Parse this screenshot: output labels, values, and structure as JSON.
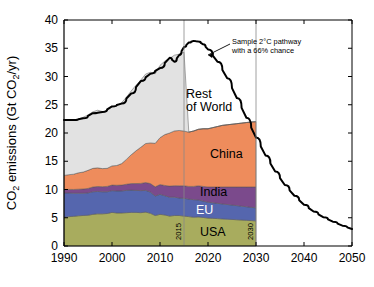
{
  "chart_data": {
    "type": "area",
    "title": "",
    "xlabel": "",
    "ylabel": "CO2 emissions (Gt CO2/yr)",
    "ylabel_parts": {
      "prefix": "CO",
      "sub1": "2",
      "mid": " emissions (Gt CO",
      "sub2": "2",
      "suffix": "/yr)"
    },
    "xlim": [
      1990,
      2050
    ],
    "ylim": [
      0,
      40
    ],
    "xticks": [
      1990,
      2000,
      2010,
      2020,
      2030,
      2040,
      2050
    ],
    "xtick_labels": [
      "1990",
      "2000",
      "2010",
      "2020",
      "2030",
      "2040",
      "2050"
    ],
    "yticks": [
      0,
      5,
      10,
      15,
      20,
      25,
      30,
      35,
      40
    ],
    "ytick_labels": [
      "0",
      "5",
      "10",
      "15",
      "20",
      "25",
      "30",
      "35",
      "40"
    ],
    "grid": false,
    "legend_position": "inline-labels",
    "stacked": true,
    "stack_x": [
      1990,
      1991,
      1992,
      1993,
      1994,
      1995,
      1996,
      1997,
      1998,
      1999,
      2000,
      2001,
      2002,
      2003,
      2004,
      2005,
      2006,
      2007,
      2008,
      2009,
      2010,
      2011,
      2012,
      2013,
      2014,
      2015,
      2016,
      2017,
      2018,
      2019,
      2020,
      2021,
      2022,
      2023,
      2024,
      2025,
      2026,
      2027,
      2028,
      2029,
      2030
    ],
    "series": [
      {
        "name": "USA",
        "color": "#A8AC5E",
        "label": "USA",
        "label_color": "#000000",
        "values": [
          5.1,
          5.2,
          5.25,
          5.35,
          5.4,
          5.45,
          5.6,
          5.7,
          5.7,
          5.75,
          5.95,
          5.85,
          5.85,
          5.9,
          5.95,
          5.95,
          5.9,
          6.0,
          5.8,
          5.4,
          5.6,
          5.5,
          5.3,
          5.4,
          5.4,
          5.3,
          5.2,
          5.1,
          5.15,
          5.05,
          4.95,
          4.9,
          4.85,
          4.8,
          4.75,
          4.7,
          4.65,
          4.6,
          4.55,
          4.5,
          4.45
        ]
      },
      {
        "name": "EU",
        "color": "#5566AE",
        "label": "EU",
        "label_color": "#ffffff",
        "values": [
          4.3,
          4.2,
          4.1,
          4.0,
          3.95,
          3.95,
          4.0,
          3.95,
          3.9,
          3.85,
          3.85,
          3.9,
          3.9,
          3.95,
          3.95,
          3.9,
          3.9,
          3.85,
          3.75,
          3.45,
          3.55,
          3.4,
          3.35,
          3.25,
          3.1,
          3.15,
          3.1,
          3.1,
          3.0,
          2.9,
          2.8,
          2.75,
          2.7,
          2.65,
          2.6,
          2.55,
          2.5,
          2.45,
          2.4,
          2.35,
          2.3
        ]
      },
      {
        "name": "India",
        "color": "#7B4A8C",
        "label": "India",
        "label_color": "#000000",
        "values": [
          0.6,
          0.62,
          0.66,
          0.7,
          0.74,
          0.79,
          0.84,
          0.88,
          0.9,
          0.95,
          0.98,
          1.0,
          1.03,
          1.08,
          1.14,
          1.2,
          1.28,
          1.38,
          1.5,
          1.62,
          1.72,
          1.82,
          1.95,
          2.02,
          2.15,
          2.2,
          2.25,
          2.35,
          2.5,
          2.6,
          2.7,
          2.8,
          2.9,
          3.0,
          3.1,
          3.2,
          3.3,
          3.4,
          3.5,
          3.6,
          3.7
        ]
      },
      {
        "name": "China",
        "color": "#EE8C5C",
        "label": "China",
        "label_color": "#000000",
        "values": [
          2.5,
          2.6,
          2.7,
          2.9,
          3.0,
          3.2,
          3.3,
          3.3,
          3.2,
          3.2,
          3.4,
          3.5,
          3.8,
          4.4,
          5.1,
          5.8,
          6.4,
          6.9,
          7.2,
          7.7,
          8.3,
          9.0,
          9.4,
          9.7,
          9.8,
          9.7,
          9.6,
          9.8,
          10.0,
          10.2,
          10.3,
          10.5,
          10.7,
          10.9,
          11.0,
          11.1,
          11.2,
          11.3,
          11.4,
          11.5,
          11.55
        ]
      },
      {
        "name": "Rest of World",
        "color": "#E2E2E2",
        "label": "Rest\nof World",
        "label_color": "#000000",
        "values": [
          9.8,
          9.7,
          9.6,
          9.5,
          9.7,
          9.8,
          10.0,
          10.2,
          10.1,
          10.2,
          10.5,
          10.6,
          10.8,
          11.0,
          11.3,
          11.6,
          11.9,
          12.3,
          12.5,
          12.3,
          12.8,
          13.0,
          13.2,
          13.4,
          13.5,
          13.95,
          0,
          0,
          0,
          0,
          0,
          0,
          0,
          0,
          0,
          0,
          0,
          0,
          0,
          0,
          0
        ]
      }
    ],
    "stack_totals": [
      22.3,
      22.3,
      22.3,
      22.45,
      22.8,
      23.2,
      23.7,
      24.0,
      23.8,
      23.95,
      24.7,
      24.8,
      25.4,
      26.4,
      27.5,
      28.5,
      29.4,
      30.4,
      30.8,
      30.5,
      32.0,
      32.7,
      33.2,
      33.8,
      34.0,
      36.3,
      36.2,
      36.3,
      36.3,
      36.2,
      36.1,
      36.0,
      35.9,
      35.8,
      35.7,
      35.6,
      35.5,
      35.4,
      35.3,
      35.2,
      22.0
    ],
    "pathway": {
      "name": "Sample 2°C pathway with a 66% chance",
      "color": "#000000",
      "x": [
        1990,
        1992,
        1994,
        1996,
        1998,
        2000,
        2002,
        2004,
        2006,
        2008,
        2010,
        2012,
        2013,
        2014,
        2015,
        2016,
        2017,
        2018,
        2019,
        2020,
        2022,
        2024,
        2026,
        2028,
        2030,
        2032,
        2034,
        2036,
        2038,
        2040,
        2042,
        2044,
        2046,
        2048,
        2050
      ],
      "y": [
        22.3,
        22.3,
        22.6,
        23.5,
        23.7,
        24.7,
        25.2,
        27.0,
        29.2,
        30.5,
        31.5,
        33.3,
        32.6,
        33.8,
        35.2,
        36.0,
        36.3,
        36.2,
        35.7,
        34.8,
        32.6,
        29.7,
        26.2,
        22.7,
        19.2,
        16.0,
        13.2,
        10.8,
        8.9,
        7.3,
        6.1,
        5.1,
        4.3,
        3.6,
        3.0
      ]
    },
    "annotations": [
      {
        "name": "pathway-callout",
        "line1": "Sample 2°C pathway",
        "line2": "with a 66% chance"
      }
    ],
    "vertical_markers": [
      {
        "name": "2015",
        "year": 2015,
        "label": "2015"
      },
      {
        "name": "2030",
        "year": 2030,
        "label": "2030"
      }
    ]
  }
}
